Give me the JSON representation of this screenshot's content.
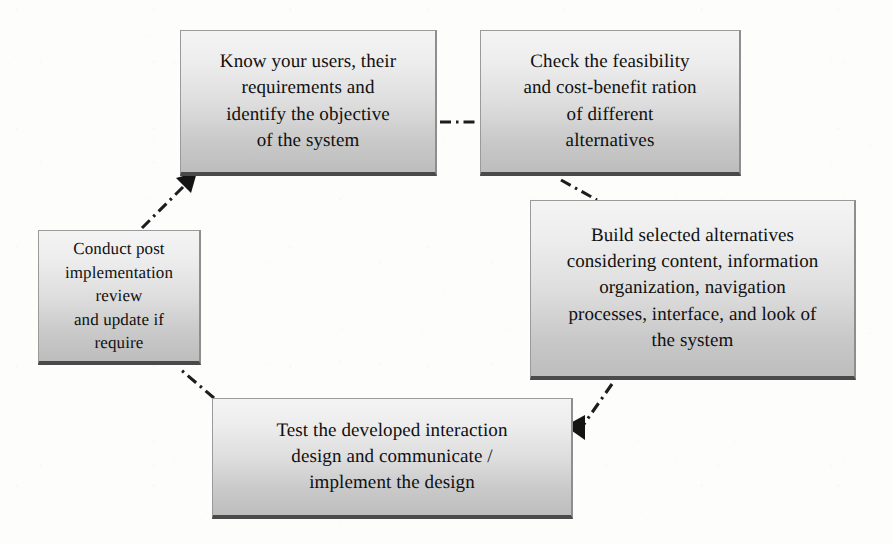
{
  "diagram": {
    "type": "cycle-flowchart",
    "background_color": "#fdfdfc",
    "node_fill_top": "#f4f4f4",
    "node_fill_bottom": "#bdbdbd",
    "node_border_color": "#9a9a9a",
    "connector_color": "#1d1d1d",
    "connector_style": "dash-dot",
    "nodes": [
      {
        "id": "know",
        "order": 1,
        "text": "Know your users, their\nrequirements and\nidentify the objective\nof the system"
      },
      {
        "id": "check",
        "order": 2,
        "text": "Check the feasibility\nand cost-benefit ration\nof different\nalternatives"
      },
      {
        "id": "build",
        "order": 3,
        "text": "Build selected alternatives\nconsidering content, information\norganization, navigation\nprocesses, interface, and look of\nthe system"
      },
      {
        "id": "test",
        "order": 4,
        "text": "Test the developed interaction\ndesign and communicate /\nimplement the design"
      },
      {
        "id": "conduct",
        "order": 5,
        "text": "Conduct post\nimplementation review\nand update if require"
      }
    ],
    "connectors": [
      {
        "id": "know-to-check",
        "from": "know",
        "to": "check",
        "arrow": false
      },
      {
        "id": "check-to-build",
        "from": "check",
        "to": "build",
        "arrow": false
      },
      {
        "id": "build-to-test",
        "from": "build",
        "to": "test",
        "arrow": true
      },
      {
        "id": "test-to-conduct",
        "from": "test",
        "to": "conduct",
        "arrow": false
      },
      {
        "id": "conduct-to-know",
        "from": "conduct",
        "to": "know",
        "arrow": true
      }
    ]
  }
}
